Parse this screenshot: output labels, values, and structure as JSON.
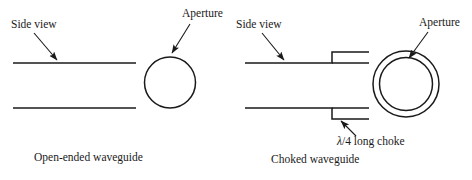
{
  "figure": {
    "background_color": "#ffffff",
    "line_color": "#1a1a1a"
  },
  "panels": [
    {
      "id": "open-ended",
      "caption": "Open-ended waveguide",
      "labels": {
        "side_view": "Side view",
        "aperture": "Aperture"
      }
    },
    {
      "id": "choked",
      "caption": "Choked waveguide",
      "labels": {
        "side_view": "Side view",
        "aperture": "Aperture",
        "choke_lambda": "λ",
        "choke_rest": "/4 long choke"
      }
    }
  ]
}
